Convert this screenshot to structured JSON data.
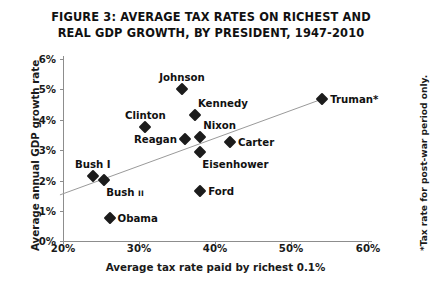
{
  "figure": {
    "title_line1": "FIGURE 3: AVERAGE TAX RATES ON RICHEST AND",
    "title_line2": "REAL GDP GROWTH, BY PRESIDENT, 1947-2010",
    "footnote": "*Tax rate for post-war period only."
  },
  "chart_data": {
    "type": "scatter",
    "title": "FIGURE 3: AVERAGE TAX RATES ON RICHEST AND REAL GDP GROWTH, BY PRESIDENT, 1947-2010",
    "xlabel": "Average tax rate paid by richest 0.1%",
    "ylabel": "Average annual GDP growth rate",
    "xlim": [
      20,
      60
    ],
    "ylim": [
      0,
      6
    ],
    "x_ticks": [
      "20%",
      "30%",
      "40%",
      "50%",
      "60%"
    ],
    "x_tick_values": [
      20,
      30,
      40,
      50,
      60
    ],
    "y_ticks": [
      "0%",
      "1%",
      "2%",
      "3%",
      "4%",
      "5%",
      "6%"
    ],
    "y_tick_values": [
      0,
      1,
      2,
      3,
      4,
      5,
      6
    ],
    "grid": false,
    "legend": "none",
    "marker": "diamond",
    "marker_color": "#1c1c1c",
    "trendline": {
      "visible": true,
      "color": "#9a9a9a",
      "x_start": 19.6,
      "y_start": 1.52,
      "x_end": 54.0,
      "y_end": 4.68
    },
    "points": [
      {
        "label": "Johnson",
        "x": 35.6,
        "y": 5.02,
        "label_pos": "above"
      },
      {
        "label": "Kennedy",
        "x": 37.3,
        "y": 4.16,
        "label_pos": "above-right"
      },
      {
        "label": "Clinton",
        "x": 30.8,
        "y": 3.76,
        "label_pos": "above"
      },
      {
        "label": "Reagan",
        "x": 36.0,
        "y": 3.37,
        "label_pos": "left"
      },
      {
        "label": "Nixon",
        "x": 38.0,
        "y": 3.43,
        "label_pos": "above-right"
      },
      {
        "label": "Carter",
        "x": 41.9,
        "y": 3.27,
        "label_pos": "right"
      },
      {
        "label": "Eisenhower",
        "x": 38.0,
        "y": 2.94,
        "label_pos": "below-right"
      },
      {
        "label": "Truman*",
        "x": 54.0,
        "y": 4.68,
        "label_pos": "right"
      },
      {
        "label": "Bush I",
        "x": 23.9,
        "y": 2.15,
        "label_pos": "above"
      },
      {
        "label": "Bush II",
        "x": 25.4,
        "y": 2.02,
        "label_pos": "below-right"
      },
      {
        "label": "Ford",
        "x": 38.0,
        "y": 1.65,
        "label_pos": "right"
      },
      {
        "label": "Obama",
        "x": 26.1,
        "y": 0.76,
        "label_pos": "right"
      }
    ]
  },
  "axes": {
    "x_title": "Average tax rate paid by richest 0.1%",
    "y_title": "Average annual GDP growth rate",
    "x_tick_labels": [
      "20%",
      "30%",
      "40%",
      "50%",
      "60%"
    ],
    "y_tick_labels": [
      "6%",
      "5%",
      "4%",
      "3%",
      "2%",
      "1%",
      "0%"
    ]
  },
  "colors": {
    "background": "#ffffff",
    "marker": "#1c1c1c",
    "axis": "#8d8d8d",
    "trendline": "#9a9a9a",
    "text": "#111111"
  }
}
